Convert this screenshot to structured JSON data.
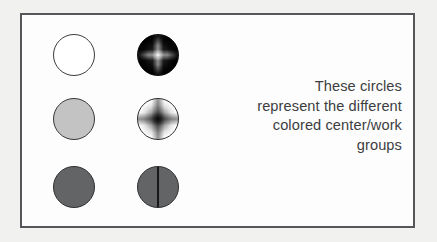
{
  "figure": {
    "background_color": "#f1f1f0",
    "panel_background": "#fdfdfd",
    "panel_border_color": "#55565a",
    "caption_color": "#3c3d3f",
    "caption": {
      "lines": [
        "These circles",
        "represent the different",
        "colored center/work",
        "groups"
      ],
      "full_text": "These circles represent the different colored center/work groups",
      "alignment": "right"
    },
    "legend_circles": [
      {
        "position": "top-left",
        "style_name": "open-white-circle",
        "fill": "#ffffff",
        "outline": "#3b3c3e",
        "pattern": "none"
      },
      {
        "position": "top-right",
        "style_name": "black-starburst-circle",
        "fill": "#0a0a0a",
        "outline": "#0a0a0a",
        "pattern": "radial-starburst-light-center"
      },
      {
        "position": "middle-left",
        "style_name": "light-grey-circle",
        "fill": "#c2c3c2",
        "outline": "#37383a",
        "pattern": "none"
      },
      {
        "position": "middle-right",
        "style_name": "white-starburst-circle",
        "fill": "#ffffff",
        "outline": "#2c2d2f",
        "pattern": "radial-starburst-dark-center"
      },
      {
        "position": "bottom-left",
        "style_name": "dark-grey-circle",
        "fill": "#636466",
        "outline": "#2e2f31",
        "pattern": "none"
      },
      {
        "position": "bottom-right",
        "style_name": "dark-grey-split-circle",
        "fill": "#636466",
        "outline": "#2e2f31",
        "pattern": "vertical-divider-line"
      }
    ]
  }
}
